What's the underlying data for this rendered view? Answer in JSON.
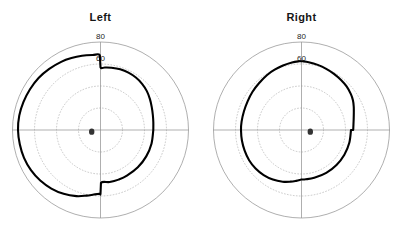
{
  "figure": {
    "background_color": "#ffffff",
    "panels": [
      {
        "id": "left-eye",
        "title": "Left",
        "eye": "Left",
        "blind_spot": {
          "x": -8,
          "y": -1.5,
          "label": "blind-spot-marker"
        }
      },
      {
        "id": "right-eye",
        "title": "Right",
        "eye": "Right",
        "blind_spot": {
          "x": 8,
          "y": -1.5,
          "label": "blind-spot-marker"
        }
      }
    ]
  },
  "chart_data": {
    "type": "line",
    "plot_style": "polar",
    "title": "",
    "subtitle": "",
    "xlabel": "",
    "ylabel": "",
    "radial_axis": {
      "label": "",
      "unit": "degrees",
      "rlim": [
        0,
        90
      ],
      "solid_ring_radius": 80,
      "dotted_ring_radii": [
        20,
        40,
        60
      ],
      "tick_labels": [
        "60",
        "80"
      ],
      "tick_label_values": [
        60,
        80
      ],
      "tick_label_angle_deg": 90
    },
    "angular_axis": {
      "grid": "crosshair",
      "axis_lines_deg": [
        0,
        90,
        180,
        270
      ],
      "tick_labels": []
    },
    "grid": true,
    "legend": false,
    "legend_position": "none",
    "colors": {
      "isopter": "#000000",
      "outer_circle": "#8c8c8c",
      "dotted_ring": "#b0b0b0",
      "axis_line": "#8c8c8c",
      "blind_spot": "#333333",
      "text": "#161616"
    },
    "series": [
      {
        "name": "Left",
        "panel": "left-eye",
        "closed": true,
        "description": "Left eye isopter: broad temporal extent to the left, vertical step edges nasally near the vertical meridian.",
        "points_deg": [
          [
            0,
            48
          ],
          [
            8,
            48.5
          ],
          [
            16,
            49.5
          ],
          [
            24,
            51
          ],
          [
            32,
            53
          ],
          [
            40,
            55
          ],
          [
            48,
            56.5
          ],
          [
            56,
            57.5
          ],
          [
            64,
            58
          ],
          [
            72,
            58
          ],
          [
            80,
            57.5
          ],
          [
            86,
            57
          ],
          [
            90,
            57
          ],
          [
            90.5,
            68
          ],
          [
            96,
            68.5
          ],
          [
            104,
            69.5
          ],
          [
            112,
            70.5
          ],
          [
            120,
            71.5
          ],
          [
            130,
            72.5
          ],
          [
            140,
            73.5
          ],
          [
            150,
            74
          ],
          [
            160,
            74.5
          ],
          [
            170,
            75
          ],
          [
            180,
            75
          ],
          [
            190,
            74.5
          ],
          [
            200,
            74
          ],
          [
            210,
            73
          ],
          [
            220,
            71.5
          ],
          [
            230,
            69.5
          ],
          [
            240,
            67
          ],
          [
            250,
            64
          ],
          [
            258,
            61
          ],
          [
            264,
            59
          ],
          [
            269,
            58
          ],
          [
            269.5,
            58
          ],
          [
            270,
            58
          ],
          [
            270.5,
            48
          ],
          [
            280,
            48
          ],
          [
            290,
            48
          ],
          [
            300,
            48
          ],
          [
            315,
            48
          ],
          [
            330,
            48
          ],
          [
            345,
            48
          ],
          [
            360,
            48
          ]
        ]
      },
      {
        "name": "Right",
        "panel": "right-eye",
        "closed": true,
        "description": "Right eye isopter: broad temporal extent to the right-ish hook in the upper quadrant, flat nasal step along the horizontal meridian.",
        "points_deg": [
          [
            0,
            47
          ],
          [
            6,
            47.5
          ],
          [
            12,
            48.5
          ],
          [
            18,
            50
          ],
          [
            24,
            52
          ],
          [
            30,
            54
          ],
          [
            36,
            55.5
          ],
          [
            44,
            57
          ],
          [
            52,
            58
          ],
          [
            60,
            59
          ],
          [
            68,
            60
          ],
          [
            76,
            61
          ],
          [
            84,
            62
          ],
          [
            89,
            62.5
          ],
          [
            90,
            62.5
          ],
          [
            92,
            62.5
          ],
          [
            98,
            62
          ],
          [
            106,
            61
          ],
          [
            114,
            60
          ],
          [
            122,
            59
          ],
          [
            132,
            57.5
          ],
          [
            142,
            56.5
          ],
          [
            152,
            55.5
          ],
          [
            162,
            55
          ],
          [
            172,
            55
          ],
          [
            180,
            55
          ],
          [
            190,
            55
          ],
          [
            200,
            55
          ],
          [
            210,
            55
          ],
          [
            220,
            54.5
          ],
          [
            230,
            53.5
          ],
          [
            240,
            52
          ],
          [
            250,
            50
          ],
          [
            258,
            48
          ],
          [
            264,
            46.5
          ],
          [
            268,
            45.5
          ],
          [
            269.5,
            45
          ],
          [
            270,
            45
          ],
          [
            275,
            45
          ],
          [
            285,
            45
          ],
          [
            300,
            45
          ],
          [
            315,
            45
          ],
          [
            330,
            45
          ],
          [
            345,
            45
          ],
          [
            360,
            45
          ]
        ]
      }
    ]
  }
}
